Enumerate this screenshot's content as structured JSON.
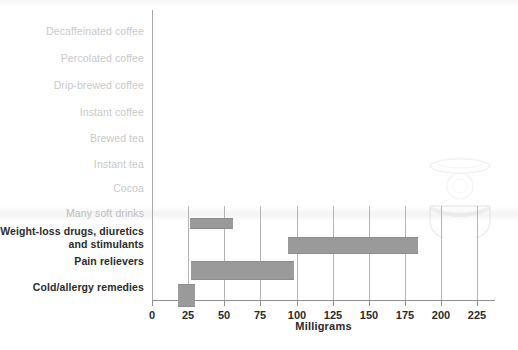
{
  "chart_data": {
    "type": "bar",
    "orientation": "horizontal",
    "title": "",
    "subtitle": "",
    "xlabel": "Milligrams",
    "ylabel": "",
    "xlim": [
      0,
      237
    ],
    "xticks": [
      0,
      25,
      50,
      75,
      100,
      125,
      150,
      175,
      200,
      225
    ],
    "xticklabels": [
      "0",
      "25",
      "50",
      "75",
      "100",
      "125",
      "150",
      "175",
      "200",
      "225"
    ],
    "grid": "vertical-partial",
    "legend": "none",
    "note": "Floating range bars (min-max caffeine content). Upper categories are faded/blank in this scan.",
    "categories": [
      "Decaffeinated coffee",
      "Percolated coffee",
      "Drip-brewed coffee",
      "Instant coffee",
      "Brewed tea",
      "Instant tea",
      "Cocoa",
      "Many soft drinks",
      "Weight-loss drugs, diuretics and stimulants",
      "Pain relievers",
      "Cold/allergy remedies"
    ],
    "bars": [
      {
        "category": "Decaffeinated coffee",
        "low": null,
        "high": null,
        "visible": false
      },
      {
        "category": "Percolated coffee",
        "low": null,
        "high": null,
        "visible": false
      },
      {
        "category": "Drip-brewed coffee",
        "low": null,
        "high": null,
        "visible": false
      },
      {
        "category": "Instant coffee",
        "low": null,
        "high": null,
        "visible": false
      },
      {
        "category": "Brewed tea",
        "low": null,
        "high": null,
        "visible": false
      },
      {
        "category": "Instant tea",
        "low": null,
        "high": null,
        "visible": false
      },
      {
        "category": "Cocoa",
        "low": null,
        "high": null,
        "visible": false
      },
      {
        "category": "Many soft drinks",
        "low": 26,
        "high": 56,
        "visible": true
      },
      {
        "category": "Weight-loss drugs, diuretics and stimulants",
        "low": 94,
        "high": 184,
        "visible": true
      },
      {
        "category": "Pain relievers",
        "low": 27,
        "high": 98,
        "visible": true
      },
      {
        "category": "Cold/allergy remedies",
        "low": 18,
        "high": 30,
        "visible": true
      }
    ],
    "colors": {
      "bar_fill": "#9a9a9a",
      "bar_stroke": "#8d8d8d",
      "axis": "#8f8f8f",
      "grid": "#b4b4b4",
      "label_dark": "#2b2b2b",
      "label_faded": "#c9c9c9",
      "background": "#ffffff"
    }
  },
  "labels": {
    "rows": [
      {
        "text": "Decaffeinated coffee",
        "tone": "faded"
      },
      {
        "text": "Percolated coffee",
        "tone": "faded"
      },
      {
        "text": "Drip-brewed coffee",
        "tone": "faded"
      },
      {
        "text": "Instant coffee",
        "tone": "faded"
      },
      {
        "text": "Brewed tea",
        "tone": "faded"
      },
      {
        "text": "Instant tea",
        "tone": "faded"
      },
      {
        "text": "Cocoa",
        "tone": "faded"
      },
      {
        "text": "Many soft drinks",
        "tone": "faded2"
      },
      {
        "text": "Weight-loss drugs, diuretics and stimulants",
        "tone": "dark"
      },
      {
        "text": "Pain relievers",
        "tone": "dark"
      },
      {
        "text": "Cold/allergy remedies",
        "tone": "dark"
      }
    ]
  },
  "axis": {
    "title": "Milligrams",
    "ticks": [
      "0",
      "25",
      "50",
      "75",
      "100",
      "125",
      "150",
      "175",
      "200",
      "225"
    ]
  }
}
